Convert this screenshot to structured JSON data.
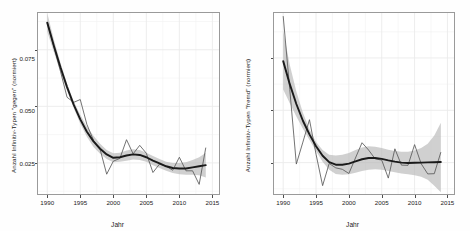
{
  "figure": {
    "background": "#fefefe",
    "panel_border_color": "#9a9a9a",
    "grid_color": "#ebebeb",
    "ribbon_color": "#b3b3b3",
    "smooth_color": "#1a1a1a",
    "raw_line_color": "#5a5a5a"
  },
  "chart_data": [
    {
      "type": "line",
      "id": "panel-left",
      "title": "",
      "xlabel": "Jahr",
      "ylabel": "Anzahl Infinitiv-Typen \"gegen\" (normiert)",
      "xlim": [
        1988.6,
        2016.0
      ],
      "ylim": [
        0.045,
        0.365
      ],
      "xticks": [
        1990,
        1995,
        2000,
        2005,
        2010,
        2015
      ],
      "xticklabels": [
        "1990",
        "1995",
        "2000",
        "2005",
        "2010",
        "2015"
      ],
      "yticks": [
        0.1,
        0.2,
        0.3
      ],
      "yticklabels": [
        "0.1",
        "0.2",
        "0.3"
      ],
      "grid": true,
      "legend": "none",
      "x": [
        1990,
        1991,
        1992,
        1993,
        1994,
        1995,
        1996,
        1997,
        1998,
        1999,
        2000,
        2001,
        2002,
        2003,
        2004,
        2005,
        2006,
        2007,
        2008,
        2009,
        2010,
        2011,
        2012,
        2013,
        2014
      ],
      "series": [
        {
          "name": "Rohdaten",
          "style": "raw",
          "values": [
            0.349,
            0.305,
            0.262,
            0.216,
            0.207,
            0.212,
            0.168,
            0.14,
            0.124,
            0.08,
            0.103,
            0.108,
            0.141,
            0.116,
            0.131,
            0.117,
            0.083,
            0.098,
            0.094,
            0.087,
            0.11,
            0.086,
            0.086,
            0.062,
            0.127
          ]
        },
        {
          "name": "LOESS-Trend",
          "style": "smooth",
          "values": [
            0.348,
            0.307,
            0.269,
            0.234,
            0.203,
            0.177,
            0.155,
            0.138,
            0.125,
            0.115,
            0.109,
            0.11,
            0.113,
            0.115,
            0.114,
            0.11,
            0.104,
            0.099,
            0.094,
            0.091,
            0.09,
            0.09,
            0.092,
            0.094,
            0.096
          ]
        },
        {
          "name": "Konfidenzband oben",
          "style": "ribbon-upper",
          "values": [
            0.365,
            0.318,
            0.277,
            0.24,
            0.209,
            0.185,
            0.164,
            0.148,
            0.134,
            0.123,
            0.117,
            0.118,
            0.122,
            0.124,
            0.123,
            0.118,
            0.112,
            0.107,
            0.102,
            0.1,
            0.1,
            0.101,
            0.105,
            0.11,
            0.118
          ]
        },
        {
          "name": "Konfidenzband unten",
          "style": "ribbon-lower",
          "values": [
            0.332,
            0.296,
            0.261,
            0.228,
            0.197,
            0.169,
            0.146,
            0.128,
            0.116,
            0.107,
            0.101,
            0.102,
            0.104,
            0.106,
            0.105,
            0.102,
            0.096,
            0.091,
            0.086,
            0.082,
            0.08,
            0.079,
            0.079,
            0.078,
            0.074
          ]
        }
      ]
    },
    {
      "type": "line",
      "id": "panel-right",
      "title": "",
      "xlabel": "Jahr",
      "ylabel": "Anzahl Infinitiv-Typen \"fremd\" (normiert)",
      "xlim": [
        1988.6,
        2016.0
      ],
      "ylim": [
        0.01,
        0.0965
      ],
      "xticks": [
        1990,
        1995,
        2000,
        2005,
        2010,
        2015
      ],
      "xticklabels": [
        "1990",
        "1995",
        "2000",
        "2005",
        "2010",
        "2015"
      ],
      "yticks": [
        0.025,
        0.05,
        0.075
      ],
      "yticklabels": [
        "0.025",
        "0.050",
        "0.075"
      ],
      "grid": true,
      "legend": "none",
      "x": [
        1990,
        1991,
        1992,
        1993,
        1994,
        1995,
        1996,
        1997,
        1998,
        1999,
        2000,
        2001,
        2002,
        2003,
        2004,
        2005,
        2006,
        2007,
        2008,
        2009,
        2010,
        2011,
        2012,
        2013,
        2014
      ],
      "series": [
        {
          "name": "Rohdaten",
          "style": "raw",
          "values": [
            0.095,
            0.06,
            0.0243,
            0.0348,
            0.0455,
            0.029,
            0.014,
            0.0246,
            0.0225,
            0.0218,
            0.0198,
            0.0272,
            0.0345,
            0.031,
            0.0268,
            0.0262,
            0.0176,
            0.0316,
            0.0238,
            0.0237,
            0.0336,
            0.0245,
            0.0196,
            0.0197,
            0.03
          ]
        },
        {
          "name": "LOESS-Trend",
          "style": "smooth",
          "values": [
            0.0735,
            0.0625,
            0.053,
            0.045,
            0.0385,
            0.0328,
            0.0283,
            0.0252,
            0.024,
            0.024,
            0.0245,
            0.0256,
            0.0266,
            0.0272,
            0.0272,
            0.0268,
            0.0261,
            0.0255,
            0.025,
            0.0248,
            0.0249,
            0.025,
            0.0251,
            0.0252,
            0.0253
          ]
        },
        {
          "name": "Konfidenzband oben",
          "style": "ribbon-upper",
          "values": [
            0.088,
            0.0718,
            0.059,
            0.0488,
            0.041,
            0.0348,
            0.031,
            0.0288,
            0.0284,
            0.0288,
            0.0296,
            0.031,
            0.0322,
            0.0328,
            0.0326,
            0.032,
            0.0312,
            0.0306,
            0.0302,
            0.0302,
            0.0308,
            0.032,
            0.034,
            0.038,
            0.044
          ]
        },
        {
          "name": "Konfidenzband unten",
          "style": "ribbon-lower",
          "values": [
            0.06,
            0.0534,
            0.047,
            0.0412,
            0.0358,
            0.0306,
            0.0254,
            0.0216,
            0.0196,
            0.0192,
            0.0194,
            0.0202,
            0.021,
            0.0216,
            0.0218,
            0.0216,
            0.021,
            0.0204,
            0.0198,
            0.0194,
            0.019,
            0.0182,
            0.0168,
            0.014,
            0.0108
          ]
        }
      ]
    }
  ]
}
